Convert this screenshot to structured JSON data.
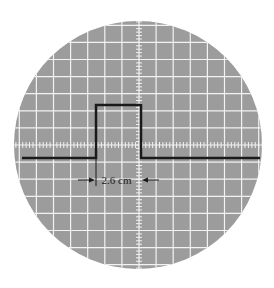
{
  "diagram": {
    "type": "oscilloscope-screen",
    "screen": {
      "center_x": 138,
      "center_y": 145,
      "radius": 124,
      "fill": "#9c9c9c",
      "grid_color": "#f2f2f2"
    },
    "grid": {
      "spacing": 17.1,
      "axis_x": 139,
      "axis_y": 145
    },
    "signal": {
      "shape": "rectangular-pulse",
      "color": "#1a1a1a",
      "baseline_y": 158,
      "top_y": 105,
      "x_start": 22,
      "rise_x": 96,
      "fall_x": 141,
      "x_end": 260
    },
    "annotation": {
      "label": "2.6 cm",
      "y": 180,
      "left_x": 96,
      "right_x": 141
    }
  }
}
